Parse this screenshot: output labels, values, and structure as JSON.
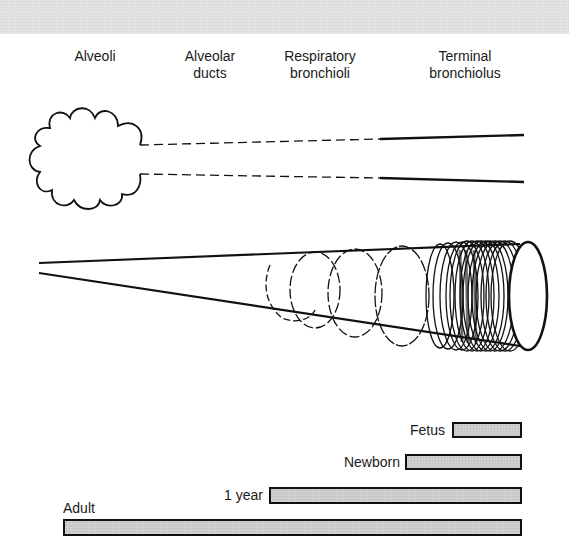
{
  "header_band": {
    "color": "#e2e2e2"
  },
  "columns": [
    {
      "line1": "Alveoli",
      "line2": ""
    },
    {
      "line1": "Alveolar",
      "line2": "ducts"
    },
    {
      "line1": "Respiratory",
      "line2": "bronchioli"
    },
    {
      "line1": "Terminal",
      "line2": "bronchiolus"
    }
  ],
  "figures": {
    "airway_schematic": "alveoli-cloud-with-ducts",
    "cone": "airway-cone-with-cartilage-rings"
  },
  "bars": [
    {
      "label": "Fetus",
      "x_start": 452,
      "x_end": 521
    },
    {
      "label": "Newborn",
      "x_start": 405,
      "x_end": 521
    },
    {
      "label": "1 year",
      "x_start": 269,
      "x_end": 521
    },
    {
      "label": "Adult",
      "x_start": 63,
      "x_end": 521
    }
  ],
  "colors": {
    "line": "#111111",
    "bar_fill": "#cfcfcf"
  }
}
